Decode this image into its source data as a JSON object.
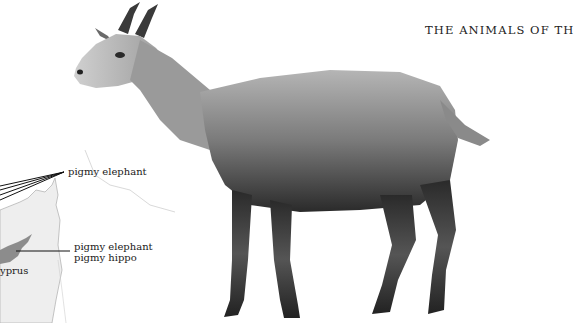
{
  "page": {
    "running_head": "THE ANIMALS OF TH"
  },
  "map": {
    "labels": {
      "top_callout": "pigmy elephant",
      "island_callout_line1": "pigmy elephant",
      "island_callout_line2": "pigmy hippo",
      "island_name": "yprus"
    },
    "colors": {
      "land": "#ececec",
      "island": "#8c8c8c",
      "coast": "#b8b8b8",
      "leader_line": "#111111"
    }
  },
  "illustration": {
    "subject": "goat",
    "colors": {
      "light_fur": "#c8c8c8",
      "mid_fur": "#8a8a8a",
      "dark_fur": "#2a2a2a"
    }
  }
}
